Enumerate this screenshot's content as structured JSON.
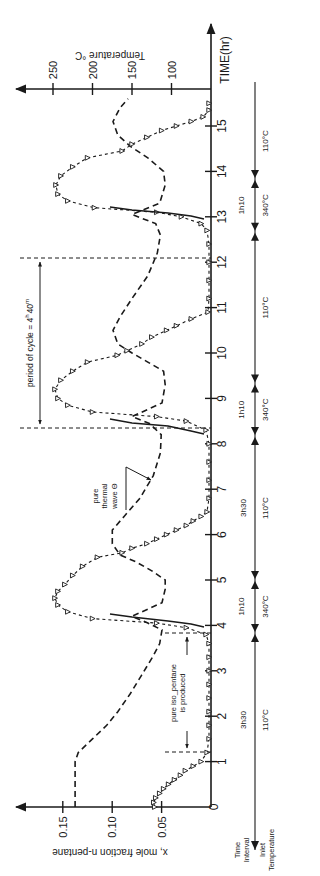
{
  "chart_data": {
    "type": "line",
    "orientation": "rotated-90-ccw",
    "title": "",
    "xlabel": "TIME(hr)",
    "ylabel": "x, mole fraction n-pentane",
    "y2label": "Temperature °C",
    "xlim": [
      0,
      15.5
    ],
    "ylim": [
      0,
      0.17
    ],
    "y2lim": [
      50,
      270
    ],
    "x_ticks": [
      0,
      1,
      2,
      3,
      4,
      5,
      6,
      7,
      8,
      9,
      10,
      11,
      12,
      13,
      14,
      15
    ],
    "y_ticks": [
      0,
      0.05,
      0.1,
      0.15
    ],
    "y_tick_labels": [
      "0",
      "0.05",
      "0.10",
      "0.15"
    ],
    "y2_ticks": [
      100,
      150,
      200,
      250
    ],
    "y2_tick_labels": [
      "100",
      "150",
      "200",
      "250"
    ],
    "grid": false,
    "series": [
      {
        "name": "x, mole fraction n-pentane (outlet)",
        "style": "triangles-dotted",
        "points": [
          [
            0.0,
            0.057
          ],
          [
            0.1,
            0.058
          ],
          [
            0.2,
            0.056
          ],
          [
            0.3,
            0.052
          ],
          [
            0.4,
            0.048
          ],
          [
            0.5,
            0.043
          ],
          [
            0.6,
            0.037
          ],
          [
            0.7,
            0.031
          ],
          [
            0.8,
            0.026
          ],
          [
            0.9,
            0.018
          ],
          [
            1.0,
            0.01
          ],
          [
            1.2,
            0.004
          ],
          [
            1.5,
            0.002
          ],
          [
            1.8,
            0.002
          ],
          [
            2.1,
            0.002
          ],
          [
            2.4,
            0.002
          ],
          [
            2.7,
            0.002
          ],
          [
            3.0,
            0.002
          ],
          [
            3.3,
            0.002
          ],
          [
            3.6,
            0.002
          ],
          [
            3.8,
            0.005
          ],
          [
            3.95,
            0.025
          ],
          [
            4.05,
            0.055
          ],
          [
            4.15,
            0.12
          ],
          [
            4.3,
            0.145
          ],
          [
            4.45,
            0.155
          ],
          [
            4.6,
            0.158
          ],
          [
            4.75,
            0.155
          ],
          [
            4.9,
            0.148
          ],
          [
            5.1,
            0.14
          ],
          [
            5.3,
            0.13
          ],
          [
            5.5,
            0.115
          ],
          [
            5.6,
            0.09
          ],
          [
            5.7,
            0.08
          ],
          [
            5.8,
            0.065
          ],
          [
            5.9,
            0.055
          ],
          [
            6.0,
            0.045
          ],
          [
            6.1,
            0.035
          ],
          [
            6.2,
            0.025
          ],
          [
            6.3,
            0.018
          ],
          [
            6.4,
            0.01
          ],
          [
            6.5,
            0.004
          ],
          [
            6.8,
            0.002
          ],
          [
            7.2,
            0.002
          ],
          [
            7.6,
            0.002
          ],
          [
            8.0,
            0.002
          ],
          [
            8.3,
            0.005
          ],
          [
            8.5,
            0.025
          ],
          [
            8.6,
            0.055
          ],
          [
            8.7,
            0.12
          ],
          [
            8.85,
            0.145
          ],
          [
            9.0,
            0.155
          ],
          [
            9.2,
            0.158
          ],
          [
            9.4,
            0.152
          ],
          [
            9.6,
            0.14
          ],
          [
            9.8,
            0.125
          ],
          [
            9.95,
            0.095
          ],
          [
            10.05,
            0.085
          ],
          [
            10.2,
            0.07
          ],
          [
            10.35,
            0.06
          ],
          [
            10.5,
            0.045
          ],
          [
            10.6,
            0.035
          ],
          [
            10.75,
            0.02
          ],
          [
            10.9,
            0.003
          ],
          [
            11.2,
            0.002
          ],
          [
            11.6,
            0.002
          ],
          [
            12.0,
            0.002
          ],
          [
            12.4,
            0.002
          ],
          [
            12.7,
            0.004
          ],
          [
            12.85,
            0.01
          ],
          [
            13.0,
            0.03
          ],
          [
            13.1,
            0.055
          ],
          [
            13.2,
            0.118
          ],
          [
            13.35,
            0.145
          ],
          [
            13.5,
            0.155
          ],
          [
            13.7,
            0.157
          ],
          [
            13.9,
            0.152
          ],
          [
            14.1,
            0.14
          ],
          [
            14.3,
            0.125
          ],
          [
            14.45,
            0.09
          ],
          [
            14.6,
            0.08
          ],
          [
            14.75,
            0.065
          ],
          [
            14.9,
            0.05
          ],
          [
            15.0,
            0.035
          ],
          [
            15.1,
            0.02
          ],
          [
            15.2,
            0.008
          ],
          [
            15.35,
            0.002
          ],
          [
            15.5,
            0.002
          ]
        ]
      },
      {
        "name": "Temperature (pure thermal wave)",
        "style": "dashed",
        "points": [
          [
            0.0,
            222
          ],
          [
            0.5,
            222
          ],
          [
            1.0,
            222
          ],
          [
            1.2,
            218
          ],
          [
            1.5,
            200
          ],
          [
            1.8,
            182
          ],
          [
            2.1,
            168
          ],
          [
            2.5,
            152
          ],
          [
            2.9,
            138
          ],
          [
            3.3,
            124
          ],
          [
            3.6,
            115
          ],
          [
            3.9,
            112
          ],
          [
            4.05,
            130
          ],
          [
            4.2,
            150
          ],
          [
            4.5,
            112
          ],
          [
            4.8,
            108
          ],
          [
            5.0,
            108
          ],
          [
            5.2,
            125
          ],
          [
            5.4,
            145
          ],
          [
            5.55,
            165
          ],
          [
            5.8,
            175
          ],
          [
            6.1,
            175
          ],
          [
            6.4,
            160
          ],
          [
            6.8,
            140
          ],
          [
            7.3,
            123
          ],
          [
            7.8,
            114
          ],
          [
            8.2,
            113
          ],
          [
            8.45,
            128
          ],
          [
            8.6,
            150
          ],
          [
            8.9,
            112
          ],
          [
            9.3,
            108
          ],
          [
            9.6,
            110
          ],
          [
            9.8,
            130
          ],
          [
            10.0,
            150
          ],
          [
            10.2,
            168
          ],
          [
            10.5,
            174
          ],
          [
            10.8,
            165
          ],
          [
            11.2,
            150
          ],
          [
            11.7,
            130
          ],
          [
            12.2,
            118
          ],
          [
            12.6,
            114
          ],
          [
            12.85,
            120
          ],
          [
            13.05,
            150
          ],
          [
            13.3,
            115
          ],
          [
            13.7,
            108
          ],
          [
            14.0,
            110
          ],
          [
            14.3,
            130
          ],
          [
            14.55,
            152
          ],
          [
            14.8,
            168
          ],
          [
            15.1,
            174
          ],
          [
            15.4,
            165
          ],
          [
            15.6,
            155
          ]
        ]
      }
    ],
    "annotations": [
      {
        "text": "period of cycle = 4h 40m",
        "from_t": 8.35,
        "to_t": 12.85
      },
      {
        "text": "pure thermal wave Θ",
        "t": 7.3
      },
      {
        "text": "pure iso-pentane is produced",
        "from_t": 1.2,
        "to_t": 3.85
      }
    ]
  },
  "axes": {
    "time_label": "TIME(hr)",
    "temp_label": "Temperature °C",
    "mole_label": "x, mole fraction n-pentane",
    "time_ticks": [
      "0",
      "1",
      "2",
      "3",
      "4",
      "5",
      "6",
      "7",
      "8",
      "9",
      "10",
      "11",
      "12",
      "13",
      "14",
      "15"
    ],
    "mole_ticks": [
      "0.05",
      "0.10",
      "0.15"
    ],
    "temp_ticks": [
      "100",
      "150",
      "200",
      "250"
    ]
  },
  "annotations": {
    "period": "period of cycle = 4",
    "period_h": "h",
    "period_m": "40",
    "period_m_sup": "m",
    "thermal_1": "pure",
    "thermal_2": "thermal",
    "thermal_3": "wave Θ",
    "iso_1": "pure iso_pentane",
    "iso_2": "is produced"
  },
  "schedule": {
    "row_labels": {
      "interval_1": "Time",
      "interval_2": "Interval",
      "inlet_1": "Inlet",
      "inlet_2": "Temperature"
    },
    "segments": [
      {
        "interval": "3h30",
        "temp": "110°C",
        "from": 0,
        "to": 3.83
      },
      {
        "interval": "1h10",
        "temp": "340°C",
        "from": 3.83,
        "to": 5.0
      },
      {
        "interval": "3h30",
        "temp": "110°C",
        "from": 5.0,
        "to": 8.17
      },
      {
        "interval": "1h10",
        "temp": "340°C",
        "from": 8.17,
        "to": 9.33
      },
      {
        "interval": "",
        "temp": "110°C",
        "from": 9.33,
        "to": 12.67
      },
      {
        "interval": "1h10",
        "temp": "340°C",
        "from": 12.67,
        "to": 13.83
      },
      {
        "interval": "",
        "temp": "110°C",
        "from": 13.83,
        "to": 15.5
      }
    ]
  }
}
